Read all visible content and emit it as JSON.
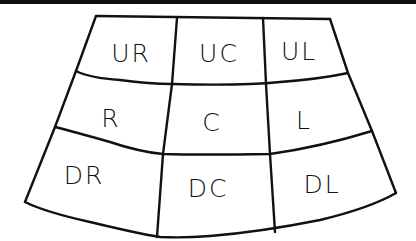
{
  "diagram": {
    "type": "fan-shaped 3x3 grid",
    "stroke_color": "#111111",
    "background_color": "#ffffff",
    "rows": [
      {
        "name": "upper",
        "cells": [
          {
            "id": "UR",
            "label": "UR"
          },
          {
            "id": "UC",
            "label": "UC"
          },
          {
            "id": "UL",
            "label": "UL"
          }
        ]
      },
      {
        "name": "middle",
        "cells": [
          {
            "id": "R",
            "label": "R"
          },
          {
            "id": "C",
            "label": "C"
          },
          {
            "id": "L",
            "label": "L"
          }
        ]
      },
      {
        "name": "lower",
        "cells": [
          {
            "id": "DR",
            "label": "DR"
          },
          {
            "id": "DC",
            "label": "DC"
          },
          {
            "id": "DL",
            "label": "DL"
          }
        ]
      }
    ]
  }
}
